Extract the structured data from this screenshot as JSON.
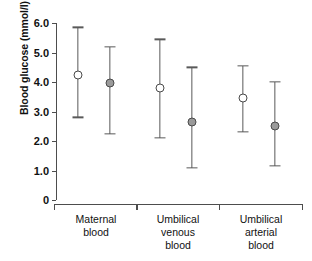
{
  "chart_data": {
    "type": "scatter",
    "title": "",
    "xlabel": "",
    "ylabel": "Blood glucose (mmol/l)",
    "ylim": [
      0,
      6.0
    ],
    "grid": false,
    "legend": "none",
    "error_bar_type": "range",
    "y_ticks": [
      {
        "value": 6.0,
        "label": "6.0"
      },
      {
        "value": 5.0,
        "label": "5.0"
      },
      {
        "value": 4.0,
        "label": "4.0"
      },
      {
        "value": 3.0,
        "label": "3.0"
      },
      {
        "value": 2.0,
        "label": "2.0"
      },
      {
        "value": 1.0,
        "label": "1.0"
      },
      {
        "value": 0.0,
        "label": "0"
      }
    ],
    "categories": [
      "Maternal blood",
      "Umbilical venous blood",
      "Umbilical arterial blood"
    ],
    "series": [
      {
        "name": "open-circle",
        "marker": "open-circle",
        "color": "#ffffff",
        "edge_color": "#4a4a4a",
        "values": [
          4.25,
          3.8,
          3.45
        ],
        "lower": [
          2.8,
          2.1,
          2.3
        ],
        "upper": [
          5.85,
          5.45,
          4.55
        ]
      },
      {
        "name": "filled-circle",
        "marker": "filled-circle",
        "color": "#9a9a9a",
        "edge_color": "#4a4a4a",
        "values": [
          3.95,
          2.65,
          2.5
        ],
        "lower": [
          2.25,
          1.1,
          1.15
        ],
        "upper": [
          5.2,
          4.5,
          4.0
        ]
      }
    ],
    "groups": [
      {
        "label_lines": [
          "Maternal",
          "blood"
        ],
        "label_text": "Maternal blood",
        "points": [
          {
            "series": "open-circle",
            "value": 4.25,
            "lower": 2.8,
            "upper": 5.85
          },
          {
            "series": "filled-circle",
            "value": 3.95,
            "lower": 2.25,
            "upper": 5.2
          }
        ]
      },
      {
        "label_lines": [
          "Umbilical",
          "venous",
          "blood"
        ],
        "label_text": "Umbilical venous blood",
        "points": [
          {
            "series": "open-circle",
            "value": 3.8,
            "lower": 2.1,
            "upper": 5.45
          },
          {
            "series": "filled-circle",
            "value": 2.65,
            "lower": 1.1,
            "upper": 4.5
          }
        ]
      },
      {
        "label_lines": [
          "Umbilical",
          "arterial",
          "blood"
        ],
        "label_text": "Umbilical arterial blood",
        "points": [
          {
            "series": "open-circle",
            "value": 3.45,
            "lower": 2.3,
            "upper": 4.55
          },
          {
            "series": "filled-circle",
            "value": 2.5,
            "lower": 1.15,
            "upper": 4.0
          }
        ]
      }
    ]
  }
}
